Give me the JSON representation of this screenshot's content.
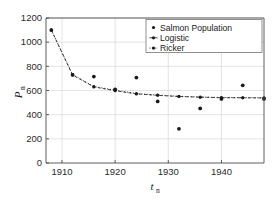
{
  "chart_data": {
    "type": "scatter",
    "title": "",
    "xlabel": "t_n",
    "ylabel": "P_n",
    "xlim": [
      1907,
      1948
    ],
    "ylim": [
      0,
      1200
    ],
    "xticks": [
      1910,
      1920,
      1930,
      1940
    ],
    "xticklabels": [
      "1910",
      "1920",
      "1930",
      "1940"
    ],
    "yticks": [
      0,
      200,
      400,
      600,
      800,
      1000,
      1200
    ],
    "yticklabels": [
      "0",
      "200",
      "400",
      "600",
      "800",
      "1000",
      "1200"
    ],
    "grid": true,
    "legend_position": "upper right",
    "marker_color": "#1a1a1a",
    "line_color": "#2a2a2a",
    "series": [
      {
        "name": "Salmon Population",
        "marker": "dot",
        "style": "scatter",
        "x": [
          1908,
          1912,
          1916,
          1920,
          1924,
          1928,
          1932,
          1936,
          1940,
          1944,
          1948
        ],
        "values": [
          1100,
          730,
          715,
          610,
          707,
          510,
          283,
          452,
          530,
          643,
          530
        ]
      },
      {
        "name": "Logistic",
        "marker": "dot",
        "style": "dashed-line",
        "x": [
          1908,
          1912,
          1916,
          1920,
          1924,
          1928,
          1932,
          1936,
          1940,
          1944,
          1948
        ],
        "values": [
          1100,
          728,
          630,
          598,
          572,
          560,
          550,
          545,
          540,
          540,
          538
        ]
      },
      {
        "name": "Ricker",
        "marker": "dot",
        "style": "dotted-line",
        "x": [
          1908,
          1912,
          1916,
          1920,
          1924,
          1928,
          1932,
          1936,
          1940,
          1944,
          1948
        ],
        "values": [
          1100,
          732,
          633,
          603,
          575,
          562,
          552,
          546,
          542,
          541,
          540
        ]
      }
    ]
  },
  "legend": {
    "entries": [
      {
        "label": "Salmon Population"
      },
      {
        "label": "Logistic"
      },
      {
        "label": "Ricker"
      }
    ]
  },
  "axes": {
    "y_title_main": "P",
    "y_title_sub": "n",
    "x_title_main": "t",
    "x_title_sub": "n"
  }
}
